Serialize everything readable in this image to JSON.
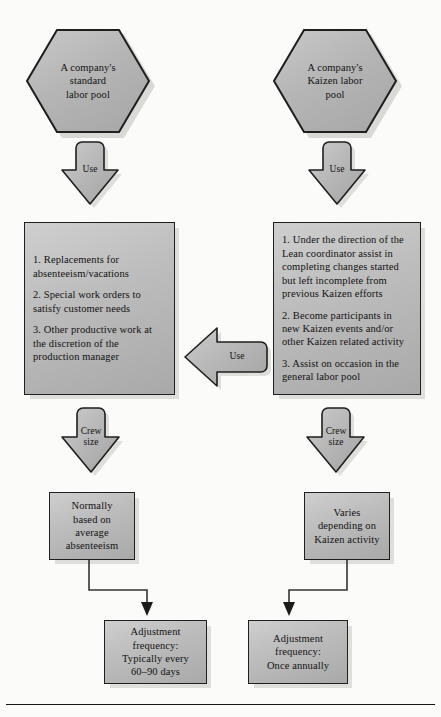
{
  "diagram": {
    "colors": {
      "shape_fill_light": "#cfcfcf",
      "shape_fill_mid": "#bdbdbd",
      "shape_fill_dark": "#a6a6a6",
      "outline": "#1f1f1f",
      "shadow": "#dededa",
      "text": "#121212",
      "page_background": "#fbfbfa"
    },
    "columns": {
      "left": "Standard labor pool branch",
      "right": "Kaizen labor pool branch"
    }
  },
  "nodes": {
    "hex_left": {
      "shape": "hexagon",
      "line1": "A company's",
      "line2": "standard",
      "line3": "labor pool"
    },
    "hex_right": {
      "shape": "hexagon",
      "line1": "A company's",
      "line2": "Kaizen labor",
      "line3": "pool"
    },
    "arrow_use_left": {
      "shape": "down-block-arrow",
      "label": "Use"
    },
    "arrow_use_right": {
      "shape": "down-block-arrow",
      "label": "Use"
    },
    "arrow_use_middle": {
      "shape": "left-block-arrow",
      "label": "Use"
    },
    "box_left_tasks": {
      "shape": "rectangle",
      "items": [
        "1. Replacements for absenteeism/vacations",
        "2. Special work orders to satisfy customer needs",
        "3. Other productive work at the discretion of the production manager"
      ]
    },
    "box_right_tasks": {
      "shape": "rectangle",
      "items": [
        "1. Under the direction of the Lean coordinator assist in completing changes started but left incomplete from previous Kaizen efforts",
        "2. Become participants in new Kaizen events and/or other Kaizen related activity",
        "3. Assist on occasion in the general labor pool"
      ]
    },
    "arrow_crew_left": {
      "shape": "down-block-arrow",
      "label_line1": "Crew",
      "label_line2": "size"
    },
    "arrow_crew_right": {
      "shape": "down-block-arrow",
      "label_line1": "Crew",
      "label_line2": "size"
    },
    "box_left_crew": {
      "shape": "rectangle",
      "line1": "Normally",
      "line2": "based on",
      "line3": "average",
      "line4": "absenteeism"
    },
    "box_right_crew": {
      "shape": "rectangle",
      "line1": "Varies",
      "line2": "depending on",
      "line3": "Kaizen activity"
    },
    "box_left_adjust": {
      "shape": "rectangle",
      "line1": "Adjustment",
      "line2": "frequency:",
      "line3": "Typically every",
      "line4": "60–90 days"
    },
    "box_right_adjust": {
      "shape": "rectangle",
      "line1": "Adjustment",
      "line2": "frequency:",
      "line3": "Once annually"
    }
  }
}
